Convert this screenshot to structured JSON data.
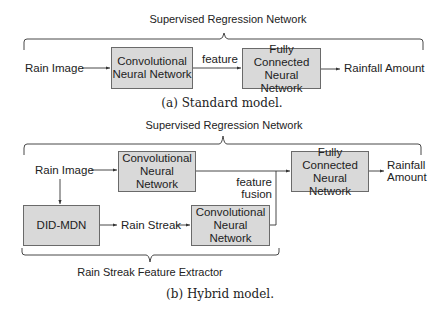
{
  "standard": {
    "brace_title": "Supervised Regression Network",
    "input_label": "Rain Image",
    "cnn_box": "Convolutional Neural Network",
    "edge_label": "feature",
    "fc_box": "Fully Connected Neural Network",
    "output_label": "Rainfall Amount",
    "caption": "(a) Standard model."
  },
  "hybrid": {
    "brace_title": "Supervised Regression Network",
    "input_label": "Rain Image",
    "cnn_top_box": "Convolutional Neural Network",
    "didmdn_box": "DID-MDN",
    "streak_label": "Rain Streak",
    "cnn_bottom_box": "Convolutional Neural Network",
    "fusion_label_1": "feature",
    "fusion_label_2": "fusion",
    "fc_box": "Fully Connected Neural Network",
    "output_label_1": "Rainfall",
    "output_label_2": "Amount",
    "bottom_brace_title": "Rain Streak Feature Extractor",
    "caption": "(b) Hybrid model."
  },
  "colors": {
    "box_fill": "#d9d9d9",
    "box_border": "#6a6a6a",
    "line": "#333333"
  }
}
